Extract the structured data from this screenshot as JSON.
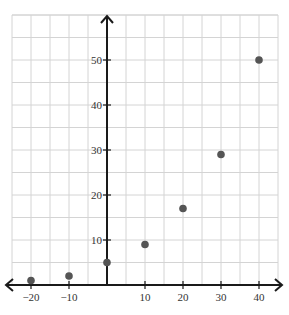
{
  "chart_data": {
    "type": "scatter",
    "title": "",
    "xlabel": "",
    "ylabel": "",
    "xlim": [
      -25,
      45
    ],
    "ylim": [
      -1,
      60
    ],
    "grid": true,
    "grid_step_x": 5,
    "grid_step_y": 5,
    "x_ticks": [
      -20,
      -10,
      10,
      20,
      30,
      40
    ],
    "y_ticks": [
      10,
      20,
      30,
      40,
      50
    ],
    "series": [
      {
        "name": "data",
        "color": "#555555",
        "points": [
          {
            "x": -20,
            "y": 1
          },
          {
            "x": -10,
            "y": 2
          },
          {
            "x": 0,
            "y": 5
          },
          {
            "x": 10,
            "y": 9
          },
          {
            "x": 20,
            "y": 17
          },
          {
            "x": 30,
            "y": 29
          },
          {
            "x": 40,
            "y": 50
          }
        ]
      }
    ]
  },
  "colors": {
    "axis": "#1a1a1a",
    "grid": "#d4d4d4",
    "point": "#555555"
  }
}
